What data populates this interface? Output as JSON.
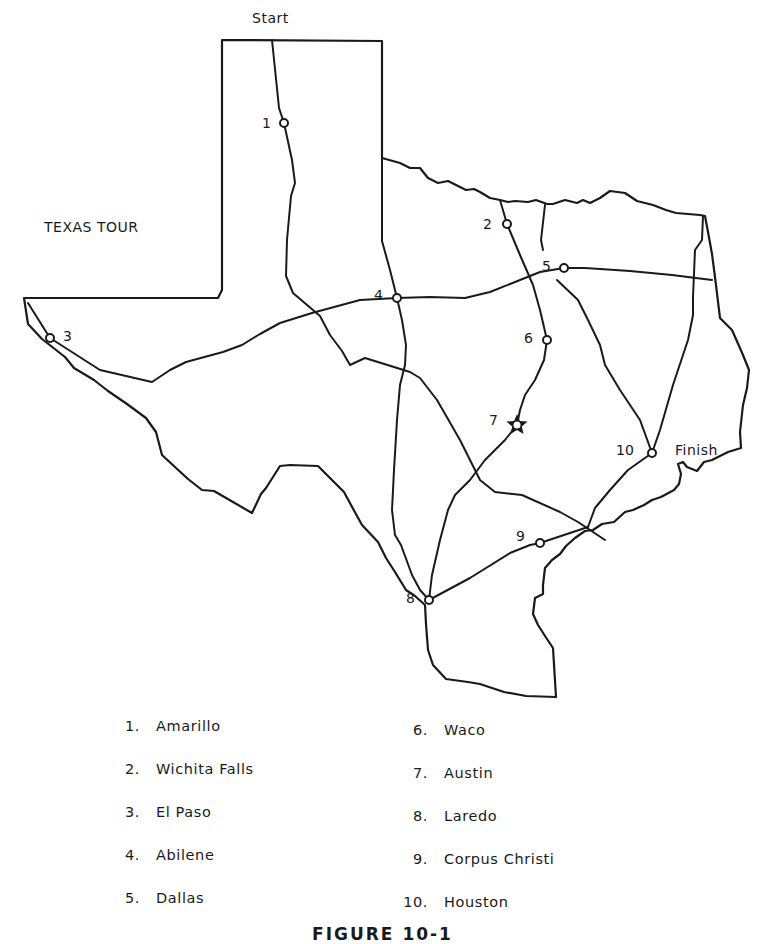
{
  "map": {
    "title": "TEXAS TOUR",
    "start_label": "Start",
    "finish_label": "Finish",
    "stops": [
      {
        "num": "1",
        "city": "Amarillo",
        "x": 284,
        "y": 123,
        "marker": "circle"
      },
      {
        "num": "2",
        "city": "Wichita Falls",
        "x": 507,
        "y": 224,
        "marker": "circle"
      },
      {
        "num": "3",
        "city": "El Paso",
        "x": 50,
        "y": 338,
        "marker": "circle"
      },
      {
        "num": "4",
        "city": "Abilene",
        "x": 397,
        "y": 298,
        "marker": "circle"
      },
      {
        "num": "5",
        "city": "Dallas",
        "x": 564,
        "y": 268,
        "marker": "circle"
      },
      {
        "num": "6",
        "city": "Waco",
        "x": 547,
        "y": 340,
        "marker": "circle"
      },
      {
        "num": "7",
        "city": "Austin",
        "x": 517,
        "y": 425,
        "marker": "star"
      },
      {
        "num": "8",
        "city": "Laredo",
        "x": 429,
        "y": 600,
        "marker": "circle"
      },
      {
        "num": "9",
        "city": "Corpus Christi",
        "x": 540,
        "y": 543,
        "marker": "circle"
      },
      {
        "num": "10",
        "city": "Houston",
        "x": 652,
        "y": 453,
        "marker": "circle"
      }
    ]
  },
  "legend": {
    "left": [
      {
        "num": "1.",
        "city": "Amarillo"
      },
      {
        "num": "2.",
        "city": "Wichita Falls"
      },
      {
        "num": "3.",
        "city": "El Paso"
      },
      {
        "num": "4.",
        "city": "Abilene"
      },
      {
        "num": "5.",
        "city": "Dallas"
      }
    ],
    "right": [
      {
        "num": "6.",
        "city": "Waco"
      },
      {
        "num": "7.",
        "city": "Austin"
      },
      {
        "num": "8.",
        "city": "Laredo"
      },
      {
        "num": "9.",
        "city": "Corpus Christi"
      },
      {
        "num": "10.",
        "city": "Houston"
      }
    ]
  },
  "caption": "FIGURE 10-1"
}
